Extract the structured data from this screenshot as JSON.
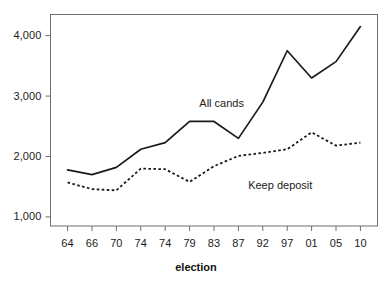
{
  "chart_data": {
    "type": "line",
    "title": "",
    "subtitle": "",
    "xlabel": "election",
    "ylabel": "",
    "categories": [
      "64",
      "66",
      "70",
      "74",
      "74",
      "79",
      "83",
      "87",
      "92",
      "97",
      "01",
      "05",
      "10"
    ],
    "xtick_labels": [
      "64",
      "66",
      "70",
      "74",
      "74",
      "79",
      "83",
      "87",
      "92",
      "97",
      "01",
      "05",
      "10"
    ],
    "ytick_labels": [
      "1,000",
      "2,000",
      "3,000",
      "4,000"
    ],
    "ytick_values": [
      1000,
      2000,
      3000,
      4000
    ],
    "ylim": [
      850,
      4350
    ],
    "xlim": [
      -0.7,
      12.7
    ],
    "grid": false,
    "legend_position": "inline-annotations",
    "series": [
      {
        "name": "All cands",
        "style": "solid",
        "color": "#1a1a1a",
        "values": [
          1780,
          1700,
          1820,
          2120,
          2230,
          2580,
          2580,
          2300,
          2900,
          3750,
          3300,
          3570,
          4150
        ]
      },
      {
        "name": "Keep deposit",
        "style": "dotted",
        "color": "#1a1a1a",
        "values": [
          1570,
          1460,
          1440,
          1800,
          1790,
          1580,
          1840,
          2010,
          2060,
          2120,
          2400,
          2180,
          2230
        ]
      }
    ],
    "annotations": [
      {
        "text": "All cands",
        "x_index": 5.4,
        "y_value": 2870
      },
      {
        "text": "Keep deposit",
        "x_index": 7.4,
        "y_value": 1520
      }
    ]
  },
  "axes": {
    "x_title": "election",
    "y_title": ""
  }
}
